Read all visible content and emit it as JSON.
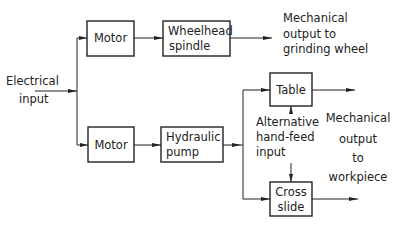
{
  "diagram": {
    "input_label": [
      "Electrical",
      "input"
    ],
    "blocks": {
      "motor_top": [
        "Motor"
      ],
      "wheelhead_spindle": [
        "Wheelhead",
        "spindle"
      ],
      "motor_bottom": [
        "Motor"
      ],
      "hydraulic_pump": [
        "Hydraulic",
        "pump"
      ],
      "table": [
        "Table"
      ],
      "cross_slide": [
        "Cross",
        "slide"
      ]
    },
    "output_wheel_label": [
      "Mechanical",
      "output to",
      "grinding wheel"
    ],
    "hand_feed_label": [
      "Alternative",
      "hand-feed",
      "input"
    ],
    "output_workpiece_label": [
      "Mechanical",
      "output",
      "to",
      "workpiece"
    ],
    "colors": {
      "ink": "#222222",
      "background": "#ffffff"
    }
  }
}
